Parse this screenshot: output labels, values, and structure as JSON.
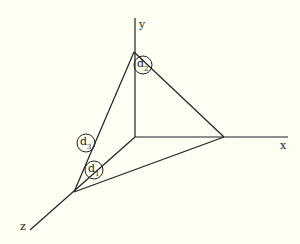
{
  "diagram": {
    "type": "3d-axes-triangle",
    "axes": {
      "x": {
        "label": "x"
      },
      "y": {
        "label": "y"
      },
      "z": {
        "label": "z"
      }
    },
    "points": {
      "origin": [
        135,
        137
      ],
      "y_apex": [
        134,
        52
      ],
      "x_point": [
        224,
        137
      ],
      "z_point": [
        74,
        192
      ]
    },
    "markers": [
      {
        "id": "d1",
        "base": "d",
        "sub": "1"
      },
      {
        "id": "d2",
        "base": "d",
        "sub": "2"
      },
      {
        "id": "d3",
        "base": "d",
        "sub": "3"
      }
    ],
    "colors": {
      "background": "#fefef2",
      "ink": "#222222"
    }
  }
}
